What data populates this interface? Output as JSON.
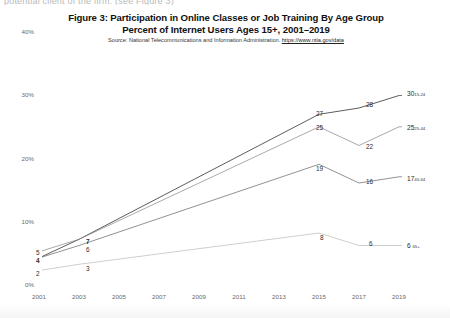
{
  "page": {
    "clipped_top_text": "potential client of the firm. (see Figure 3)"
  },
  "chart_data": {
    "type": "line",
    "title": "Figure 3: Participation in Online Classes or Job Training By Age Group",
    "subtitle": "Percent of Internet Users Ages 15+, 2001–2019",
    "source_prefix": "Source: National Telecommunications and Information Administration. ",
    "source_link": "https://www.ntia.gov/data",
    "xlabel": "",
    "ylabel": "",
    "x": [
      2001,
      2003,
      2015,
      2017,
      2019
    ],
    "x_ticks": [
      "2001",
      "2003",
      "2005",
      "2007",
      "2009",
      "2011",
      "2013",
      "2015",
      "2017",
      "2019"
    ],
    "y_ticks": [
      "0%",
      "10%",
      "20%",
      "30%",
      "40%"
    ],
    "ylim": [
      0,
      40
    ],
    "xlim": [
      2001,
      2019
    ],
    "grid": false,
    "legend_position": "right-end-labels",
    "series": [
      {
        "name": "15-24",
        "color": "#4a4a4a",
        "values": [
          4,
          7,
          27,
          28,
          30
        ],
        "labels": [
          "4",
          "7",
          "27",
          "28",
          "30"
        ],
        "end_label_value": "30",
        "end_label_group": "15-24"
      },
      {
        "name": "25-44",
        "color": "#8c8c8c",
        "values": [
          5,
          7,
          25,
          22,
          25
        ],
        "labels": [
          "5",
          "7",
          "25",
          "22",
          "25"
        ],
        "end_label_value": "25",
        "end_label_group": "25-44"
      },
      {
        "name": "45-64",
        "color": "#6e6e6e",
        "values": [
          4,
          6,
          19,
          16,
          17
        ],
        "labels": [
          "4",
          "6",
          "19",
          "16",
          "17"
        ],
        "end_label_value": "17",
        "end_label_group": "45-64"
      },
      {
        "name": "65+",
        "color": "#bdbdbd",
        "values": [
          2,
          3,
          8,
          6,
          6
        ],
        "labels": [
          "2",
          "3",
          "8",
          "6",
          "6"
        ],
        "end_label_value": "6",
        "end_label_group": "65+"
      }
    ],
    "point_labels": [
      {
        "text": "5",
        "x": 36,
        "y": 249,
        "bold": false
      },
      {
        "text": "4",
        "x": 36,
        "y": 257,
        "bold": true
      },
      {
        "text": "2",
        "x": 36,
        "y": 270,
        "bold": false
      },
      {
        "text": "7",
        "x": 86,
        "y": 238,
        "bold": true
      },
      {
        "text": "6",
        "x": 86,
        "y": 246,
        "bold": false
      },
      {
        "text": "3",
        "x": 86,
        "y": 265,
        "bold": false
      },
      {
        "text": "27",
        "x": 316,
        "y": 110,
        "bold": false
      },
      {
        "text": "25",
        "x": 316,
        "y": 124,
        "bold": false
      },
      {
        "text": "19",
        "x": 316,
        "y": 165,
        "bold": false
      },
      {
        "text": "8",
        "x": 320,
        "y": 234,
        "bold": false
      },
      {
        "text": "28",
        "x": 366,
        "y": 101,
        "bold": false
      },
      {
        "text": "22",
        "x": 366,
        "y": 143,
        "bold": false
      },
      {
        "text": "16",
        "x": 366,
        "y": 178,
        "bold": false
      },
      {
        "text": "6",
        "x": 369,
        "y": 240,
        "bold": false
      }
    ]
  }
}
